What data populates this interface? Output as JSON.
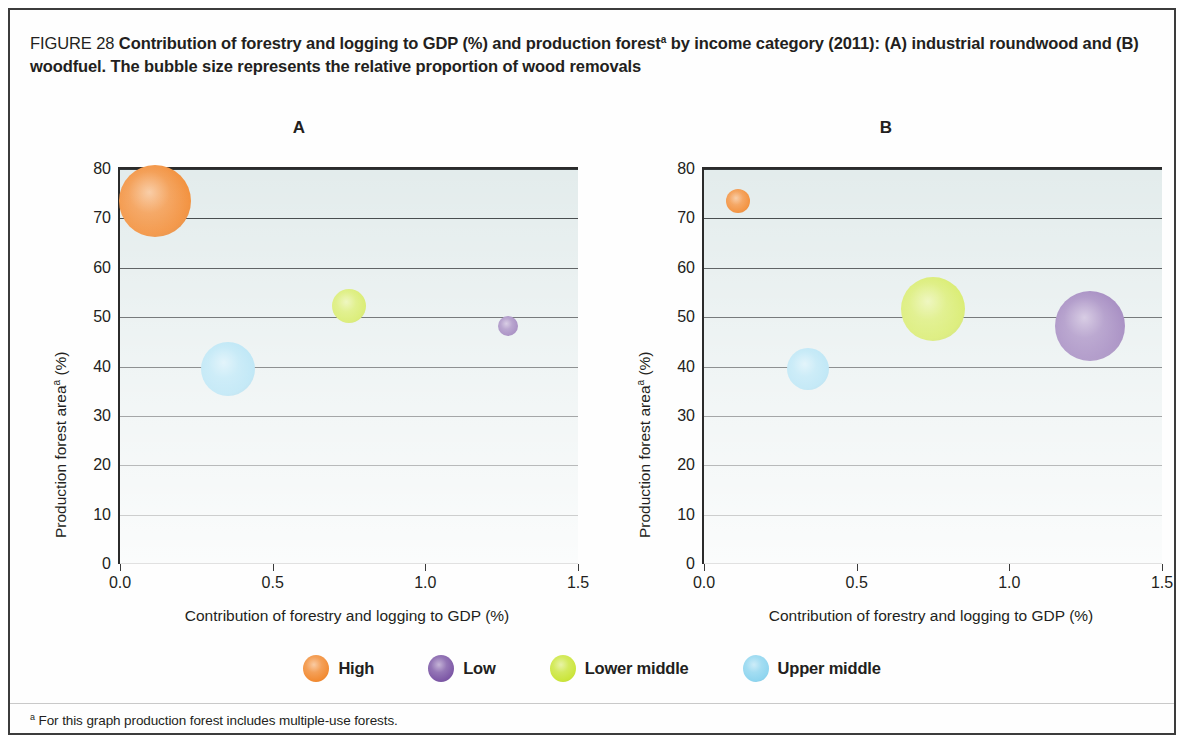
{
  "figure": {
    "number_label": "FIGURE 28",
    "title_line1": "Contribution of forestry and logging to GDP (%) and production forest",
    "title_sup": "a",
    "title_line1_cont": " by income category (2011):",
    "title_line2": "(A) industrial roundwood and (B) woodfuel. The bubble size represents the relative proportion of wood removals",
    "footnote_marker": "a",
    "footnote_text": " For this graph production forest includes multiple-use forests."
  },
  "legend": {
    "items": [
      {
        "label": "High",
        "color": "#f28b33"
      },
      {
        "label": "Low",
        "color": "#7d58a6"
      },
      {
        "label": "Lower middle",
        "color": "#cbe53b"
      },
      {
        "label": "Upper middle",
        "color": "#8fd5ef"
      }
    ]
  },
  "chart_data": [
    {
      "type": "scatter",
      "panel": "A",
      "title": "A",
      "subtitle": "industrial roundwood",
      "xlabel": "Contribution of forestry and logging to GDP (%)",
      "ylabel": "Production forest areaᵃ (%)",
      "xlim": [
        0.0,
        1.5
      ],
      "ylim": [
        0,
        80
      ],
      "xticks": [
        "0.0",
        "0.5",
        "1.0",
        "1.5"
      ],
      "xtick_values": [
        0.0,
        0.5,
        1.0,
        1.5
      ],
      "yticks": [
        "0",
        "10",
        "20",
        "30",
        "40",
        "50",
        "60",
        "70",
        "80"
      ],
      "ytick_values": [
        0,
        10,
        20,
        30,
        40,
        50,
        60,
        70,
        80
      ],
      "grid": true,
      "legend_position": "bottom",
      "points": [
        {
          "name": "High",
          "x": 0.115,
          "y": 73.5,
          "size": 72,
          "color": "#f28b33"
        },
        {
          "name": "Upper middle",
          "x": 0.355,
          "y": 39.4,
          "size": 54,
          "color": "#8fd5ef"
        },
        {
          "name": "Lower middle",
          "x": 0.75,
          "y": 52.2,
          "size": 34,
          "color": "#cbe53b"
        },
        {
          "name": "Low",
          "x": 1.27,
          "y": 48.2,
          "size": 20,
          "color": "#7d58a6"
        }
      ]
    },
    {
      "type": "scatter",
      "panel": "B",
      "title": "B",
      "subtitle": "woodfuel",
      "xlabel": "Contribution of forestry and logging to GDP (%)",
      "ylabel": "Production forest areaᵃ (%)",
      "xlim": [
        0.0,
        1.5
      ],
      "ylim": [
        0,
        80
      ],
      "xticks": [
        "0.0",
        "0.5",
        "1.0",
        "1.5"
      ],
      "xtick_values": [
        0.0,
        0.5,
        1.0,
        1.5
      ],
      "yticks": [
        "0",
        "10",
        "20",
        "30",
        "40",
        "50",
        "60",
        "70",
        "80"
      ],
      "ytick_values": [
        0,
        10,
        20,
        30,
        40,
        50,
        60,
        70,
        80
      ],
      "grid": true,
      "legend_position": "bottom",
      "points": [
        {
          "name": "High",
          "x": 0.11,
          "y": 73.5,
          "size": 24,
          "color": "#f28b33"
        },
        {
          "name": "Upper middle",
          "x": 0.34,
          "y": 39.4,
          "size": 42,
          "color": "#8fd5ef"
        },
        {
          "name": "Lower middle",
          "x": 0.75,
          "y": 51.6,
          "size": 64,
          "color": "#cbe53b"
        },
        {
          "name": "Low",
          "x": 1.265,
          "y": 48.2,
          "size": 70,
          "color": "#7d58a6"
        }
      ]
    }
  ]
}
